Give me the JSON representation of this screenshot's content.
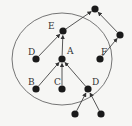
{
  "diagram": {
    "type": "tree-with-enclosing-circle",
    "colors": {
      "node": "#1a1a1a",
      "edge": "#444444",
      "circle": "#666666",
      "background": "#f6f6f4"
    },
    "circle": {
      "cx": 62,
      "cy": 59,
      "rx": 50,
      "ry": 46
    },
    "nodes": [
      {
        "id": "top",
        "label": "",
        "x": 95,
        "y": 9
      },
      {
        "id": "E",
        "label": "E",
        "x": 63,
        "y": 31,
        "lx": 48,
        "ly": 29
      },
      {
        "id": "R",
        "label": "",
        "x": 120,
        "y": 35
      },
      {
        "id": "D1",
        "label": "D",
        "x": 36,
        "y": 59,
        "lx": 28,
        "ly": 55
      },
      {
        "id": "A",
        "label": "A",
        "x": 62,
        "y": 59,
        "lx": 67,
        "ly": 54
      },
      {
        "id": "F",
        "label": "F",
        "x": 100,
        "y": 59,
        "lx": 101,
        "ly": 55
      },
      {
        "id": "B",
        "label": "B",
        "x": 36,
        "y": 89,
        "lx": 28,
        "ly": 85
      },
      {
        "id": "C",
        "label": "C",
        "x": 62,
        "y": 89,
        "lx": 54,
        "ly": 85
      },
      {
        "id": "D2",
        "label": "D",
        "x": 88,
        "y": 89,
        "lx": 92,
        "ly": 85
      },
      {
        "id": "L1",
        "label": "",
        "x": 75,
        "y": 114
      },
      {
        "id": "L2",
        "label": "",
        "x": 101,
        "y": 114
      }
    ],
    "edges": [
      {
        "from": "E",
        "to": "top"
      },
      {
        "from": "R",
        "to": "top"
      },
      {
        "from": "D1",
        "to": "E"
      },
      {
        "from": "A",
        "to": "E"
      },
      {
        "from": "F",
        "to": "R"
      },
      {
        "from": "B",
        "to": "A"
      },
      {
        "from": "C",
        "to": "A"
      },
      {
        "from": "D2",
        "to": "A"
      },
      {
        "from": "L1",
        "to": "D2"
      },
      {
        "from": "L2",
        "to": "D2"
      }
    ]
  }
}
